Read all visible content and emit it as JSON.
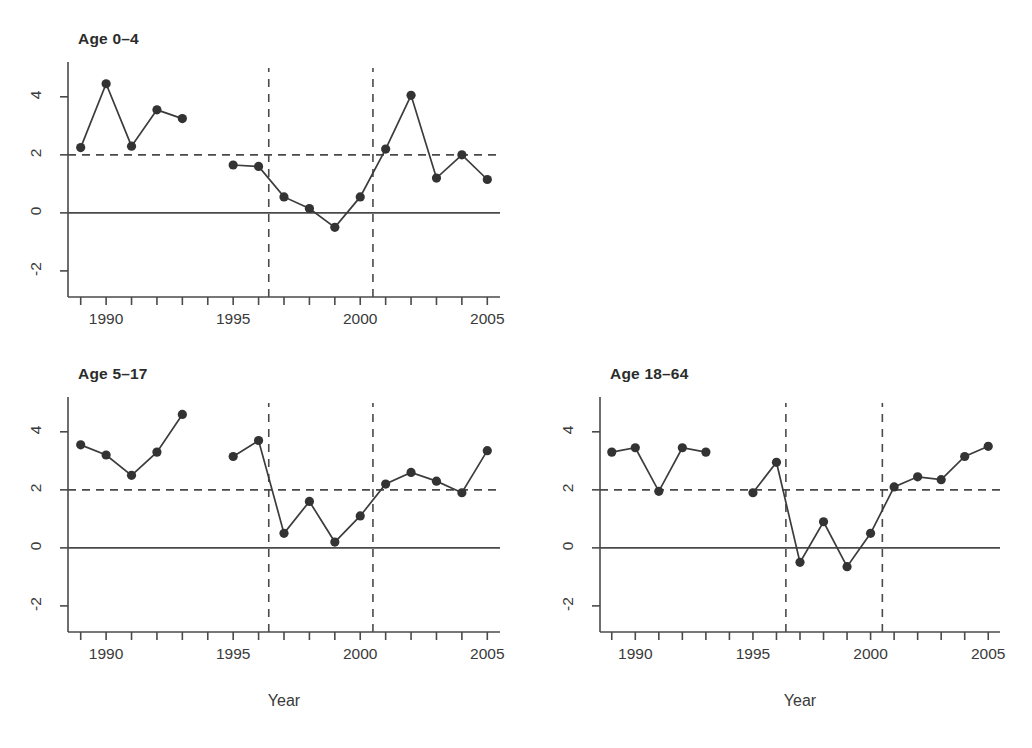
{
  "figure": {
    "background": "#ffffff",
    "line_color": "#3c3c3c",
    "point_color": "#333333",
    "reference_line_color": "#4a4a4a"
  },
  "axis": {
    "xlabel": "Year",
    "x_tick_labels": [
      "1990",
      "1995",
      "2000",
      "2005"
    ],
    "x_tick_values": [
      1990,
      1995,
      2000,
      2005
    ],
    "y_tick_labels": [
      "-2",
      "0",
      "2",
      "4"
    ],
    "y_tick_values": [
      -2,
      0,
      2,
      4
    ],
    "x_minor_ticks": [
      1989,
      1990,
      1991,
      1992,
      1993,
      1994,
      1995,
      1996,
      1997,
      1998,
      1999,
      2000,
      2001,
      2002,
      2003,
      2004,
      2005
    ]
  },
  "panels": [
    {
      "id": "age-0-4",
      "title": "Age 0–4",
      "show_xlabel": false
    },
    {
      "id": "age-5-17",
      "title": "Age 5–17",
      "show_xlabel": true
    },
    {
      "id": "age-18-64",
      "title": "Age 18–64",
      "show_xlabel": true
    }
  ],
  "chart_data": [
    {
      "type": "line",
      "title": "Age 0–4",
      "xlabel": "",
      "ylabel": "",
      "xlim": [
        1988.5,
        2005.5
      ],
      "ylim": [
        -2.9,
        5.2
      ],
      "grid": false,
      "legend": "none",
      "x": [
        1989,
        1990,
        1991,
        1992,
        1993,
        1995,
        1996,
        1997,
        1998,
        1999,
        2000,
        2001,
        2002,
        2003,
        2004,
        2005
      ],
      "y": [
        2.25,
        4.45,
        2.3,
        3.55,
        3.25,
        1.65,
        1.6,
        0.55,
        0.15,
        -0.5,
        0.55,
        2.2,
        4.05,
        1.2,
        2.0,
        1.15
      ],
      "segments": [
        {
          "x": [
            1989,
            1990,
            1991,
            1992,
            1993
          ],
          "y": [
            2.25,
            4.45,
            2.3,
            3.55,
            3.25
          ]
        },
        {
          "x": [
            1995,
            1996,
            1997,
            1998,
            1999,
            2000,
            2001,
            2002,
            2003,
            2004,
            2005
          ],
          "y": [
            1.65,
            1.6,
            0.55,
            0.15,
            -0.5,
            0.55,
            2.2,
            4.05,
            1.2,
            2.0,
            1.15
          ]
        }
      ],
      "annotations": {
        "hline_dashed_y": 2,
        "hline_solid_y": 0,
        "vline_dashed_x": [
          1996.4,
          2000.5
        ]
      }
    },
    {
      "type": "line",
      "title": "Age 5–17",
      "xlabel": "Year",
      "ylabel": "",
      "xlim": [
        1988.5,
        2005.5
      ],
      "ylim": [
        -2.9,
        5.2
      ],
      "grid": false,
      "legend": "none",
      "x": [
        1989,
        1990,
        1991,
        1992,
        1993,
        1995,
        1996,
        1997,
        1998,
        1999,
        2000,
        2001,
        2002,
        2003,
        2004,
        2005
      ],
      "y": [
        3.55,
        3.2,
        2.5,
        3.3,
        4.6,
        3.15,
        3.7,
        0.5,
        1.6,
        0.2,
        1.1,
        2.2,
        2.6,
        2.3,
        1.9,
        3.35
      ],
      "segments": [
        {
          "x": [
            1989,
            1990,
            1991,
            1992,
            1993
          ],
          "y": [
            3.55,
            3.2,
            2.5,
            3.3,
            4.6
          ]
        },
        {
          "x": [
            1995,
            1996,
            1997,
            1998,
            1999,
            2000,
            2001,
            2002,
            2003,
            2004,
            2005
          ],
          "y": [
            3.15,
            3.7,
            0.5,
            1.6,
            0.2,
            1.1,
            2.2,
            2.6,
            2.3,
            1.9,
            3.35
          ]
        }
      ],
      "annotations": {
        "hline_dashed_y": 2,
        "hline_solid_y": 0,
        "vline_dashed_x": [
          1996.4,
          2000.5
        ]
      }
    },
    {
      "type": "line",
      "title": "Age 18–64",
      "xlabel": "Year",
      "ylabel": "",
      "xlim": [
        1988.5,
        2005.5
      ],
      "ylim": [
        -2.9,
        5.2
      ],
      "grid": false,
      "legend": "none",
      "x": [
        1989,
        1990,
        1991,
        1992,
        1993,
        1995,
        1996,
        1997,
        1998,
        1999,
        2000,
        2001,
        2002,
        2003,
        2004,
        2005
      ],
      "y": [
        3.3,
        3.45,
        1.95,
        3.45,
        3.3,
        1.9,
        2.95,
        -0.5,
        0.9,
        -0.65,
        0.5,
        2.1,
        2.45,
        2.35,
        3.15,
        3.5
      ],
      "segments": [
        {
          "x": [
            1989,
            1990,
            1991,
            1992,
            1993
          ],
          "y": [
            3.3,
            3.45,
            1.95,
            3.45,
            3.3
          ]
        },
        {
          "x": [
            1995,
            1996,
            1997,
            1998,
            1999,
            2000,
            2001,
            2002,
            2003,
            2004,
            2005
          ],
          "y": [
            1.9,
            2.95,
            -0.5,
            0.9,
            -0.65,
            0.5,
            2.1,
            2.45,
            2.35,
            3.15,
            3.5
          ]
        }
      ],
      "annotations": {
        "hline_dashed_y": 2,
        "hline_solid_y": 0,
        "vline_dashed_x": [
          1996.4,
          2000.5
        ]
      }
    }
  ]
}
